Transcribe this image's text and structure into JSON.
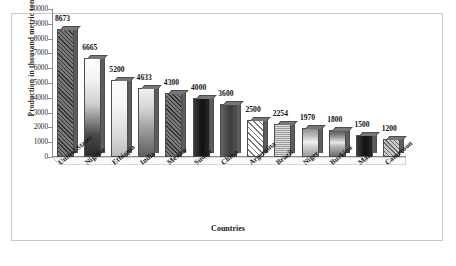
{
  "chart_data": {
    "type": "bar",
    "title": "",
    "xlabel": "Countries",
    "ylabel": "Production in thousand metric tons",
    "categories": [
      "United States",
      "Nigeria",
      "Ethiopia",
      "India",
      "Mexico",
      "Sudan",
      "China",
      "Argentina",
      "Brazil",
      "Niger",
      "Burkina",
      "Mali",
      "Cameroon"
    ],
    "values": [
      8673,
      6665,
      5200,
      4633,
      4300,
      4000,
      3600,
      2500,
      2254,
      1970,
      1800,
      1500,
      1200
    ],
    "value_labels": [
      "8673",
      "6665",
      "5200",
      "4633",
      "4300",
      "4000",
      "3600",
      "2500",
      "2254",
      "1970",
      "1800",
      "1500",
      "1200"
    ],
    "ylim": [
      0,
      10000
    ],
    "ytick_labels": [
      "10000",
      "9000",
      "8000",
      "7000",
      "6000",
      "5000",
      "4000",
      "3000",
      "2000",
      "1000",
      "0"
    ],
    "ytick_values": [
      10000,
      9000,
      8000,
      7000,
      6000,
      5000,
      4000,
      3000,
      2000,
      1000,
      0
    ],
    "grid": false,
    "legend": "none",
    "bar_fills": [
      "fill-hatch-dark",
      "fill-grad-down",
      "fill-grad-light",
      "fill-grad-mid",
      "fill-hatch-dark",
      "fill-solid-black",
      "fill-solid-dark",
      "fill-hatch-white",
      "fill-dot-gray",
      "fill-band-a",
      "fill-band-b",
      "fill-solid-black",
      "fill-hatch-gray"
    ]
  },
  "style": {
    "frame_color": "#c9c9c9",
    "axis_color": "#8a8a8a",
    "text_color": "#1a1a1a",
    "background": "#ffffff"
  }
}
